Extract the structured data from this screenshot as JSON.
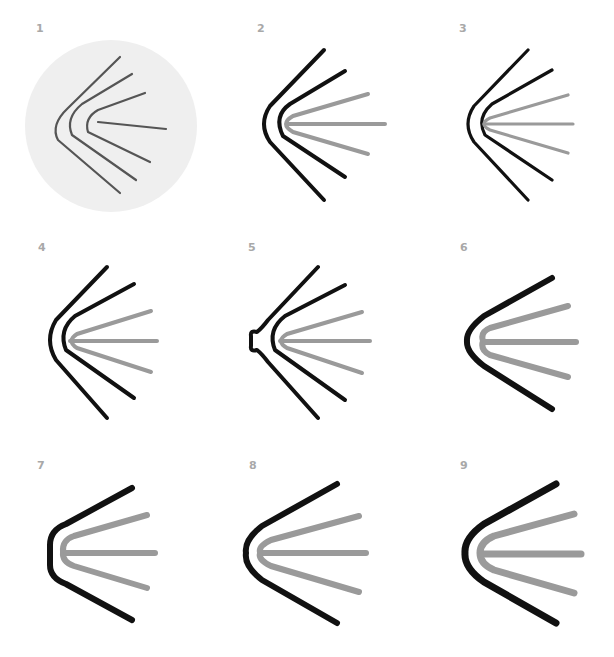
{
  "colors": {
    "black": "#111111",
    "gray": "#9a9a9a",
    "sketch": "#555555",
    "sketch_bg": "#efefef",
    "label": "#a8a8a8"
  },
  "panels": [
    {
      "number": "1",
      "label_x": 36,
      "label_y": 30,
      "style": "sketch",
      "circle": {
        "cx": 111,
        "cy": 126,
        "r": 86
      },
      "paths": [
        {
          "d": "M120,57 L68,108 Q50,125 58,140 L120,193",
          "color": "sketch",
          "width": 2.2
        },
        {
          "d": "M132,74 L82,104 Q65,118 72,135 L136,180",
          "color": "sketch",
          "width": 2.2
        },
        {
          "d": "M145,93 L98,110 Q84,118 88,132 L150,162",
          "color": "sketch",
          "width": 2.2
        },
        {
          "d": "M98,122 L166,129",
          "color": "sketch",
          "width": 2.2
        }
      ]
    },
    {
      "number": "2",
      "label_x": 257,
      "label_y": 30,
      "style": "vector",
      "paths": [
        {
          "d": "M324,50 L270,106 Q258,124 270,142 L324,200",
          "color": "black",
          "width": 4
        },
        {
          "d": "M345,71 L290,104 Q273,116 283,136 L345,177",
          "color": "black",
          "width": 4
        },
        {
          "d": "M368,94 L293,116 Q279,124 293,132 L368,154",
          "color": "gray",
          "width": 4
        },
        {
          "d": "M287,124 L385,124",
          "color": "gray",
          "width": 4
        }
      ]
    },
    {
      "number": "3",
      "label_x": 459,
      "label_y": 30,
      "style": "vector",
      "paths": [
        {
          "d": "M528,50 L474,106 Q462,124 474,142 L528,200",
          "color": "black",
          "width": 3.2
        },
        {
          "d": "M552,70 L492,104 Q476,118 485,135 L552,180",
          "color": "black",
          "width": 3.2
        },
        {
          "d": "M568,95 L490,118 Q478,124 490,130 L568,153",
          "color": "gray",
          "width": 3.2
        },
        {
          "d": "M484,124 L573,124",
          "color": "gray",
          "width": 3.2
        }
      ]
    },
    {
      "number": "4",
      "label_x": 38,
      "label_y": 249,
      "style": "vector",
      "paths": [
        {
          "d": "M107,267 L56,320 Q44,340 56,360 L107,418",
          "color": "black",
          "width": 4
        },
        {
          "d": "M134,284 L75,316 Q58,330 66,350 L134,398",
          "color": "black",
          "width": 4
        },
        {
          "d": "M151,311 L77,334 Q66,341 77,348 L151,372",
          "color": "gray",
          "width": 4
        },
        {
          "d": "M70,341 L157,341",
          "color": "gray",
          "width": 4
        }
      ]
    },
    {
      "number": "5",
      "label_x": 248,
      "label_y": 249,
      "style": "vector",
      "paths": [
        {
          "d": "M318,267 L268,320 Q262,328 257,332 Q250,330 251,336 L251,346 Q250,352 257,350 Q262,354 268,362 L318,418",
          "color": "black",
          "width": 4
        },
        {
          "d": "M345,285 L285,316 Q267,330 275,350 L345,400",
          "color": "black",
          "width": 4
        },
        {
          "d": "M362,312 L287,334 Q275,341 287,348 L362,373",
          "color": "gray",
          "width": 4
        },
        {
          "d": "M280,341 L370,341",
          "color": "gray",
          "width": 4
        }
      ]
    },
    {
      "number": "6",
      "label_x": 460,
      "label_y": 249,
      "style": "vector",
      "paths": [
        {
          "d": "M552,278 L484,316 Q466,330 467,341 Q466,352 484,366 L552,409",
          "color": "black",
          "width": 6
        },
        {
          "d": "M568,306 L490,328 Q480,332 483,341",
          "color": "gray",
          "width": 6
        },
        {
          "d": "M568,377 L490,355 Q480,350 483,341",
          "color": "gray",
          "width": 6
        },
        {
          "d": "M485,342 L576,342",
          "color": "gray",
          "width": 6
        }
      ]
    },
    {
      "number": "7",
      "label_x": 37,
      "label_y": 467,
      "style": "vector",
      "paths": [
        {
          "d": "M132,488 L66,524 Q50,530 50,545 L50,565 Q50,578 66,584 L132,620",
          "color": "black",
          "width": 6
        },
        {
          "d": "M147,515 L74,536 Q62,540 63,552",
          "color": "gray",
          "width": 6
        },
        {
          "d": "M147,588 L74,566 Q62,562 63,552",
          "color": "gray",
          "width": 6
        },
        {
          "d": "M66,553 L155,553",
          "color": "gray",
          "width": 6
        }
      ]
    },
    {
      "number": "8",
      "label_x": 249,
      "label_y": 467,
      "style": "vector",
      "paths": [
        {
          "d": "M337,484 L262,526 Q244,540 246,553 Q244,566 262,580 L337,623",
          "color": "black",
          "width": 6
        },
        {
          "d": "M359,516 L271,540 Q258,546 260,553 Q258,560 271,566 L359,592",
          "color": "gray",
          "width": 6
        },
        {
          "d": "M262,553 L366,553",
          "color": "gray",
          "width": 6
        }
      ]
    },
    {
      "number": "9",
      "label_x": 460,
      "label_y": 467,
      "style": "vector",
      "paths": [
        {
          "d": "M556,484 L484,524 Q464,538 465,553 Q464,568 484,582 L556,623",
          "color": "black",
          "width": 7
        },
        {
          "d": "M574,514 L494,536 Q480,542 480,553 Q480,564 494,570 L574,593",
          "color": "gray",
          "width": 7
        },
        {
          "d": "M482,554 L581,554",
          "color": "gray",
          "width": 7
        }
      ]
    }
  ]
}
